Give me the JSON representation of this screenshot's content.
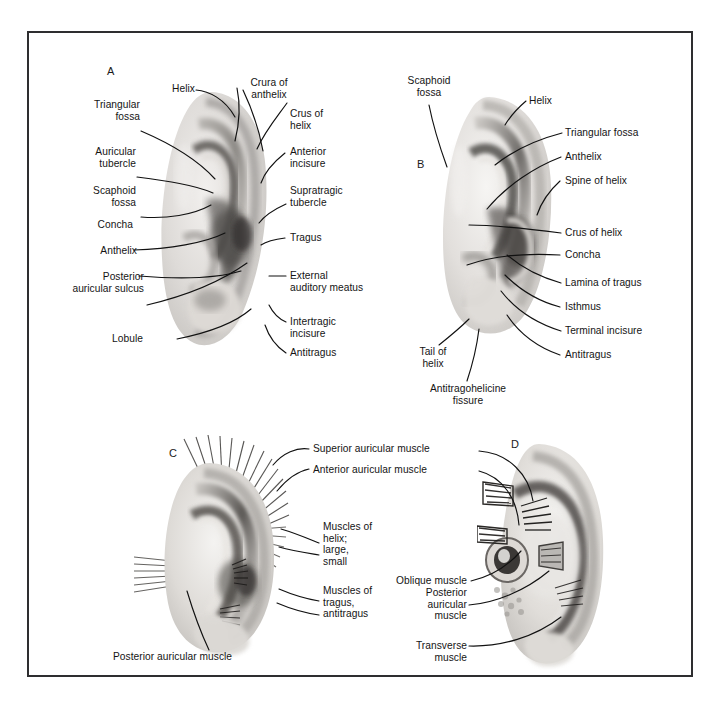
{
  "figure": {
    "type": "anatomical-illustration",
    "background_color": "#ffffff",
    "border_color": "#2e2e30",
    "label_color": "#141414",
    "leader_color": "#111111"
  },
  "panels": [
    {
      "id": "A",
      "letter": "A",
      "caption": "Lateral surface of the auricle — surface landmarks",
      "labels": [
        {
          "name": "helix",
          "text": "Helix"
        },
        {
          "name": "crura-of-anthelix",
          "text": "Crura of\nanthelix"
        },
        {
          "name": "triangular-fossa",
          "text": "Triangular\nfossa"
        },
        {
          "name": "crus-of-helix",
          "text": "Crus of\nhelix"
        },
        {
          "name": "auricular-tubercle",
          "text": "Auricular\ntubercle"
        },
        {
          "name": "anterior-incisure",
          "text": "Anterior\nincisure"
        },
        {
          "name": "scaphoid-fossa",
          "text": "Scaphoid\nfossa"
        },
        {
          "name": "supratragic-tubercle",
          "text": "Supratragic\ntubercle"
        },
        {
          "name": "concha",
          "text": "Concha"
        },
        {
          "name": "tragus",
          "text": "Tragus"
        },
        {
          "name": "anthelix",
          "text": "Anthelix"
        },
        {
          "name": "external-auditory-meatus",
          "text": "External\nauditory meatus"
        },
        {
          "name": "posterior-auricular-sulcus",
          "text": "Posterior\nauricular sulcus"
        },
        {
          "name": "intertragic-incisure",
          "text": "Intertragic\nincisure"
        },
        {
          "name": "lobule",
          "text": "Lobule"
        },
        {
          "name": "antitragus",
          "text": "Antitragus"
        }
      ]
    },
    {
      "id": "B",
      "letter": "B",
      "caption": "Auricle — detail of tragus, antitragus and incisures",
      "labels": [
        {
          "name": "scaphoid-fossa",
          "text": "Scaphoid\nfossa"
        },
        {
          "name": "helix",
          "text": "Helix"
        },
        {
          "name": "triangular-fossa",
          "text": "Triangular fossa"
        },
        {
          "name": "anthelix",
          "text": "Anthelix"
        },
        {
          "name": "spine-of-helix",
          "text": "Spine of helix"
        },
        {
          "name": "crus-of-helix",
          "text": "Crus of helix"
        },
        {
          "name": "concha",
          "text": "Concha"
        },
        {
          "name": "lamina-of-tragus",
          "text": "Lamina of tragus"
        },
        {
          "name": "isthmus",
          "text": "Isthmus"
        },
        {
          "name": "terminal-incisure",
          "text": "Terminal incisure"
        },
        {
          "name": "antitragus",
          "text": "Antitragus"
        },
        {
          "name": "tail-of-helix",
          "text": "Tail of\nhelix"
        },
        {
          "name": "antitragohelicine-fissure",
          "text": "Antitragohelicine\nfissure"
        }
      ]
    },
    {
      "id": "C",
      "letter": "C",
      "caption": "Extrinsic and intrinsic muscles — lateral aspect",
      "labels": [
        {
          "name": "superior-auricular-muscle",
          "text": "Superior auricular muscle"
        },
        {
          "name": "anterior-auricular-muscle",
          "text": "Anterior auricular muscle"
        },
        {
          "name": "muscles-of-helix",
          "text": "Muscles of\nhelix;\nlarge,\nsmall"
        },
        {
          "name": "muscles-of-tragus-antitragus",
          "text": "Muscles of\ntragus,\nantitragus"
        },
        {
          "name": "posterior-auricular-muscle",
          "text": "Posterior auricular muscle"
        }
      ]
    },
    {
      "id": "D",
      "letter": "D",
      "caption": "Intrinsic muscles — medial (cranial) aspect",
      "labels": [
        {
          "name": "oblique-muscle",
          "text": "Oblique muscle"
        },
        {
          "name": "posterior-auricular-muscle",
          "text": "Posterior\nauricular\nmuscle"
        },
        {
          "name": "transverse-muscle",
          "text": "Transverse\nmuscle"
        }
      ]
    }
  ]
}
